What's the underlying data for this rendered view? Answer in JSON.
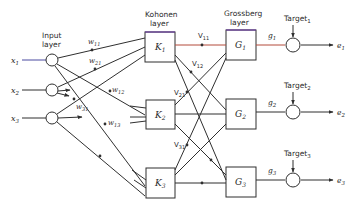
{
  "diagram": {
    "colors": {
      "line": "#2f2f2f",
      "kohonen_top": "#6b3fa0",
      "highlight": "#b34a3a",
      "input_line": "#4a4aa0"
    },
    "layers": {
      "input_label_1": "Input",
      "input_label_2": "layer",
      "kohonen_label_1": "Kohonen",
      "kohonen_label_2": "layer",
      "grossberg_label_1": "Grossberg",
      "grossberg_label_2": "layer"
    },
    "inputs": [
      {
        "name": "x",
        "sub": "1"
      },
      {
        "name": "x",
        "sub": "2"
      },
      {
        "name": "x",
        "sub": "3"
      }
    ],
    "kohonen": [
      {
        "name": "K",
        "sub": "1"
      },
      {
        "name": "K",
        "sub": "2"
      },
      {
        "name": "K",
        "sub": "3"
      }
    ],
    "grossberg": [
      {
        "name": "G",
        "sub": "1"
      },
      {
        "name": "G",
        "sub": "2"
      },
      {
        "name": "G",
        "sub": "3"
      }
    ],
    "input_weights": [
      {
        "name": "w",
        "sub": "11"
      },
      {
        "name": "w",
        "sub": "21"
      },
      {
        "name": "w",
        "sub": "12"
      },
      {
        "name": "w",
        "sub": "31"
      },
      {
        "name": "w",
        "sub": "13"
      }
    ],
    "output_weights": [
      {
        "name": "V",
        "sub": "11"
      },
      {
        "name": "V",
        "sub": "12"
      },
      {
        "name": "V",
        "sub": "21"
      },
      {
        "name": "V",
        "sub": "31"
      }
    ],
    "grossberg_outputs": [
      {
        "name": "g",
        "sub": "1"
      },
      {
        "name": "g",
        "sub": "2"
      },
      {
        "name": "g",
        "sub": "3"
      }
    ],
    "targets": [
      {
        "name": "Target",
        "sub": "1"
      },
      {
        "name": "Target",
        "sub": "2"
      },
      {
        "name": "Target",
        "sub": "3"
      }
    ],
    "errors": [
      {
        "name": "e",
        "sub": "1"
      },
      {
        "name": "e",
        "sub": "2"
      },
      {
        "name": "e",
        "sub": "3"
      }
    ]
  }
}
